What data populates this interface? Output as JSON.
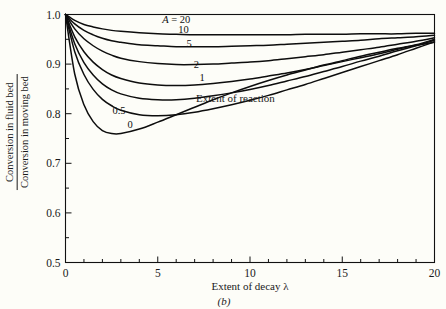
{
  "figure": {
    "panel_label": "(b)",
    "background_color": "#fdfdf8",
    "line_color": "#0d0d0d"
  },
  "axes": {
    "ylabel_numerator": "Conversion in fluid bed",
    "ylabel_denominator": "Conversion in moving bed",
    "xlabel": "Extent of decay λ",
    "x_ticks": [
      "0",
      "5",
      "10",
      "15",
      "20"
    ],
    "y_ticks": [
      "0.5",
      "0.6",
      "0.7",
      "0.8",
      "0.9",
      "1.0"
    ]
  },
  "annotations": {
    "extent_of_reaction": "Extent of reaction",
    "series_prefix": "A ="
  },
  "chart_data": {
    "type": "line",
    "title": "",
    "xlabel": "Extent of decay λ",
    "ylabel": "Conversion in fluid bed / Conversion in moving bed",
    "xlim": [
      0,
      20
    ],
    "ylim": [
      0.5,
      1.0
    ],
    "x_major_ticks": [
      0,
      5,
      10,
      15,
      20
    ],
    "y_major_ticks": [
      0.5,
      0.6,
      0.7,
      0.8,
      0.9,
      1.0
    ],
    "x_minor_tick_step": 1,
    "y_minor_tick_step": 0.05,
    "grid": false,
    "legend": "inline-curve-labels",
    "series_parameter": "A",
    "x": [
      0,
      0.5,
      1,
      1.5,
      2,
      2.5,
      3,
      4,
      5,
      6,
      7,
      8,
      9,
      10,
      11,
      12,
      13,
      14,
      15,
      16,
      17,
      18,
      19,
      20
    ],
    "series": [
      {
        "name": "20",
        "label": "A = 20",
        "label_x": 6.0,
        "label_y": 0.982,
        "values": [
          1.0,
          0.988,
          0.98,
          0.975,
          0.971,
          0.968,
          0.966,
          0.963,
          0.961,
          0.96,
          0.959,
          0.959,
          0.959,
          0.959,
          0.959,
          0.959,
          0.96,
          0.96,
          0.96,
          0.961,
          0.961,
          0.961,
          0.962,
          0.962
        ]
      },
      {
        "name": "10",
        "label": "10",
        "label_x": 6.4,
        "label_y": 0.962,
        "values": [
          1.0,
          0.981,
          0.968,
          0.959,
          0.952,
          0.947,
          0.944,
          0.939,
          0.937,
          0.935,
          0.935,
          0.935,
          0.936,
          0.937,
          0.938,
          0.94,
          0.942,
          0.944,
          0.946,
          0.948,
          0.951,
          0.953,
          0.955,
          0.958
        ]
      },
      {
        "name": "5",
        "label": "5",
        "label_x": 6.7,
        "label_y": 0.934,
        "values": [
          1.0,
          0.971,
          0.951,
          0.937,
          0.926,
          0.918,
          0.912,
          0.905,
          0.901,
          0.899,
          0.899,
          0.9,
          0.902,
          0.904,
          0.907,
          0.911,
          0.915,
          0.919,
          0.924,
          0.929,
          0.934,
          0.94,
          0.946,
          0.953
        ]
      },
      {
        "name": "2",
        "label": "2",
        "label_x": 7.1,
        "label_y": 0.892,
        "values": [
          1.0,
          0.955,
          0.925,
          0.904,
          0.889,
          0.878,
          0.871,
          0.862,
          0.858,
          0.857,
          0.858,
          0.861,
          0.865,
          0.87,
          0.876,
          0.882,
          0.889,
          0.897,
          0.905,
          0.913,
          0.921,
          0.93,
          0.939,
          0.95
        ]
      },
      {
        "name": "1",
        "label": "1",
        "label_x": 7.4,
        "label_y": 0.866,
        "values": [
          1.0,
          0.941,
          0.903,
          0.878,
          0.86,
          0.848,
          0.84,
          0.831,
          0.828,
          0.828,
          0.831,
          0.836,
          0.842,
          0.849,
          0.857,
          0.866,
          0.875,
          0.885,
          0.895,
          0.906,
          0.916,
          0.927,
          0.937,
          0.948
        ]
      },
      {
        "name": "0.5",
        "label": "0.5",
        "label_x": 2.9,
        "label_y": 0.8,
        "values": [
          1.0,
          0.925,
          0.879,
          0.849,
          0.829,
          0.816,
          0.807,
          0.798,
          0.796,
          0.798,
          0.803,
          0.81,
          0.818,
          0.827,
          0.837,
          0.848,
          0.859,
          0.871,
          0.883,
          0.895,
          0.907,
          0.919,
          0.932,
          0.945
        ]
      },
      {
        "name": "0",
        "label": "0",
        "label_x": 3.5,
        "label_y": 0.772,
        "values": [
          1.0,
          0.88,
          0.818,
          0.784,
          0.766,
          0.76,
          0.76,
          0.769,
          0.783,
          0.798,
          0.813,
          0.828,
          0.842,
          0.855,
          0.867,
          0.878,
          0.888,
          0.898,
          0.907,
          0.916,
          0.924,
          0.932,
          0.938,
          0.944
        ]
      }
    ]
  }
}
